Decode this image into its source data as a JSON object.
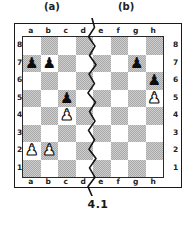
{
  "figure": {
    "caption": "4.1",
    "section_labels": [
      {
        "id": "a",
        "text": "(a)"
      },
      {
        "id": "b",
        "text": "(b)"
      }
    ]
  },
  "board": {
    "files": [
      "a",
      "b",
      "c",
      "d",
      "e",
      "f",
      "g",
      "h"
    ],
    "ranks": [
      "8",
      "7",
      "6",
      "5",
      "4",
      "3",
      "2",
      "1"
    ],
    "dark_square_color": "#a8a8a8",
    "light_square_color": "#ffffff",
    "border_color": "#1a1a1a",
    "divider": {
      "name": "zigzag-divider",
      "between_files": "d-e",
      "color": "#141414"
    },
    "pieces": [
      {
        "square": "a7",
        "color": "black",
        "type": "pawn",
        "glyph": "♟",
        "file": 0,
        "rank": 1
      },
      {
        "square": "b7",
        "color": "black",
        "type": "pawn",
        "glyph": "♟",
        "file": 1,
        "rank": 1
      },
      {
        "square": "g7",
        "color": "black",
        "type": "pawn",
        "glyph": "♟",
        "file": 6,
        "rank": 1
      },
      {
        "square": "h6",
        "color": "black",
        "type": "pawn",
        "glyph": "♟",
        "file": 7,
        "rank": 2
      },
      {
        "square": "c5",
        "color": "black",
        "type": "pawn",
        "glyph": "♟",
        "file": 2,
        "rank": 3
      },
      {
        "square": "h5",
        "color": "white",
        "type": "pawn",
        "glyph": "♟",
        "file": 7,
        "rank": 3
      },
      {
        "square": "c4",
        "color": "white",
        "type": "pawn",
        "glyph": "♟",
        "file": 2,
        "rank": 4
      },
      {
        "square": "a2",
        "color": "white",
        "type": "pawn",
        "glyph": "♟",
        "file": 0,
        "rank": 6
      },
      {
        "square": "b2",
        "color": "white",
        "type": "pawn",
        "glyph": "♟",
        "file": 1,
        "rank": 6
      }
    ]
  }
}
